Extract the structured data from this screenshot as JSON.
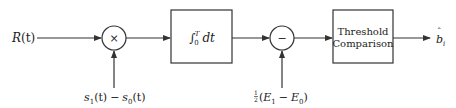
{
  "diagram": {
    "type": "block-diagram",
    "input": {
      "label": "R(t)",
      "main": "R",
      "arg": "(t)"
    },
    "multiplier": {
      "symbol": "×",
      "reference_input": {
        "label": "s1(t) − s0(t)",
        "s": "s",
        "sub1": "1",
        "sub0": "0",
        "arg": "(t)",
        "minus": "−"
      }
    },
    "integrator": {
      "label": "∫0^T dt",
      "integral": "∫",
      "lower": "0",
      "upper": "T",
      "dt": "dt"
    },
    "subtractor": {
      "symbol": "−",
      "bias_input": {
        "label": "½(E1 − E0)",
        "frac_num": "1",
        "frac_den": "2",
        "open": "(",
        "E": "E",
        "sub1": "1",
        "sub0": "0",
        "minus": "−",
        "close": ")"
      }
    },
    "threshold": {
      "line1": "Threshold",
      "line2": "Comparison"
    },
    "output": {
      "label": "b̂_i",
      "main": "b",
      "hat": "ˆ",
      "sub": "i"
    },
    "colors": {
      "stroke": "#333333",
      "text": "#222222",
      "background": "#ffffff"
    }
  }
}
